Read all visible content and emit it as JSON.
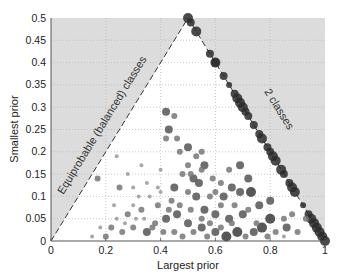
{
  "chart_data": {
    "type": "scatter",
    "title": "",
    "xlabel": "Largest prior",
    "ylabel": "Smallest prior",
    "xlim": [
      0,
      1
    ],
    "ylim": [
      0,
      0.5
    ],
    "xticks": [
      0,
      0.2,
      0.4,
      0.6,
      0.8,
      1
    ],
    "xtick_labels": [
      "0",
      "0.2",
      "0.4",
      "0.6",
      "0.8",
      "1"
    ],
    "yticks": [
      0,
      0.05,
      0.1,
      0.15,
      0.2,
      0.25,
      0.3,
      0.35,
      0.4,
      0.45,
      0.5
    ],
    "ytick_labels": [
      "0",
      "0.05",
      "0.1",
      "0.15",
      "0.2",
      "0.25",
      "0.3",
      "0.35",
      "0.4",
      "0.45",
      "0.5"
    ],
    "grid": true,
    "grid_style": "dotted",
    "legend": null,
    "annotations": [
      {
        "text": "Equiprobable (balanced) classes",
        "along": "line y = x",
        "style": "dashed"
      },
      {
        "text": "2 classes",
        "along": "line y = 1 - x",
        "style": "dashed"
      }
    ],
    "infeasible_region_shading": "light gray outside triangle (0,0)-(0.5,0.5)-(1,0)",
    "series": [
      {
        "name": "two-class datasets",
        "points": [
          [
            0.5,
            0.5,
            5
          ],
          [
            0.51,
            0.49,
            4
          ],
          [
            0.53,
            0.47,
            5
          ],
          [
            0.58,
            0.42,
            4
          ],
          [
            0.6,
            0.4,
            5
          ],
          [
            0.6,
            0.4,
            4
          ],
          [
            0.63,
            0.37,
            4
          ],
          [
            0.65,
            0.35,
            3
          ],
          [
            0.67,
            0.33,
            4
          ],
          [
            0.68,
            0.32,
            5
          ],
          [
            0.69,
            0.31,
            5
          ],
          [
            0.7,
            0.3,
            5
          ],
          [
            0.71,
            0.29,
            4
          ],
          [
            0.72,
            0.28,
            4
          ],
          [
            0.74,
            0.26,
            4
          ],
          [
            0.76,
            0.24,
            4
          ],
          [
            0.77,
            0.23,
            5
          ],
          [
            0.79,
            0.21,
            4
          ],
          [
            0.8,
            0.2,
            4
          ],
          [
            0.81,
            0.19,
            5
          ],
          [
            0.82,
            0.18,
            5
          ],
          [
            0.84,
            0.16,
            5
          ],
          [
            0.85,
            0.15,
            4
          ],
          [
            0.87,
            0.13,
            4
          ],
          [
            0.88,
            0.12,
            5
          ],
          [
            0.89,
            0.11,
            5
          ],
          [
            0.92,
            0.08,
            3
          ],
          [
            0.94,
            0.06,
            4
          ],
          [
            0.95,
            0.05,
            5
          ],
          [
            0.96,
            0.04,
            5
          ],
          [
            0.97,
            0.03,
            5
          ],
          [
            0.98,
            0.02,
            5
          ],
          [
            0.99,
            0.01,
            5
          ],
          [
            1.0,
            0.0,
            5
          ]
        ]
      },
      {
        "name": "multi-class datasets",
        "points": [
          [
            0.42,
            0.29,
            4
          ],
          [
            0.45,
            0.28,
            3
          ],
          [
            0.43,
            0.25,
            4
          ],
          [
            0.42,
            0.23,
            3
          ],
          [
            0.46,
            0.23,
            3
          ],
          [
            0.5,
            0.21,
            4
          ],
          [
            0.53,
            0.19,
            3
          ],
          [
            0.55,
            0.2,
            3
          ],
          [
            0.56,
            0.17,
            4
          ],
          [
            0.48,
            0.15,
            3
          ],
          [
            0.52,
            0.14,
            4
          ],
          [
            0.51,
            0.15,
            3
          ],
          [
            0.54,
            0.13,
            4
          ],
          [
            0.59,
            0.14,
            3
          ],
          [
            0.62,
            0.13,
            3
          ],
          [
            0.6,
            0.11,
            3
          ],
          [
            0.17,
            0.14,
            3
          ],
          [
            0.25,
            0.12,
            3
          ],
          [
            0.45,
            0.12,
            4
          ],
          [
            0.5,
            0.11,
            3
          ],
          [
            0.53,
            0.1,
            4
          ],
          [
            0.58,
            0.1,
            3
          ],
          [
            0.63,
            0.1,
            4
          ],
          [
            0.69,
            0.11,
            4
          ],
          [
            0.73,
            0.11,
            5
          ],
          [
            0.66,
            0.12,
            4
          ],
          [
            0.72,
            0.14,
            4
          ],
          [
            0.76,
            0.08,
            4
          ],
          [
            0.8,
            0.09,
            4
          ],
          [
            0.8,
            0.05,
            5
          ],
          [
            0.85,
            0.05,
            3
          ],
          [
            0.86,
            0.03,
            4
          ],
          [
            0.77,
            0.03,
            5
          ],
          [
            0.74,
            0.02,
            4
          ],
          [
            0.68,
            0.02,
            5
          ],
          [
            0.64,
            0.01,
            5
          ],
          [
            0.6,
            0.02,
            4
          ],
          [
            0.55,
            0.03,
            4
          ],
          [
            0.5,
            0.04,
            4
          ],
          [
            0.46,
            0.06,
            4
          ],
          [
            0.42,
            0.05,
            4
          ],
          [
            0.38,
            0.04,
            3
          ],
          [
            0.35,
            0.02,
            4
          ],
          [
            0.3,
            0.03,
            3
          ],
          [
            0.26,
            0.02,
            3
          ],
          [
            0.22,
            0.03,
            3
          ],
          [
            0.2,
            0.01,
            3
          ],
          [
            0.28,
            0.06,
            3
          ],
          [
            0.33,
            0.07,
            3
          ],
          [
            0.39,
            0.08,
            3
          ],
          [
            0.44,
            0.09,
            3
          ],
          [
            0.56,
            0.07,
            4
          ],
          [
            0.6,
            0.06,
            4
          ],
          [
            0.65,
            0.05,
            4
          ],
          [
            0.7,
            0.06,
            4
          ],
          [
            0.75,
            0.04,
            3
          ],
          [
            0.82,
            0.02,
            3
          ],
          [
            0.9,
            0.02,
            3
          ],
          [
            0.93,
            0.05,
            3
          ],
          [
            0.88,
            0.06,
            3
          ],
          [
            0.3,
            0.08,
            2
          ],
          [
            0.32,
            0.1,
            2
          ],
          [
            0.36,
            0.1,
            2
          ],
          [
            0.4,
            0.11,
            2
          ],
          [
            0.34,
            0.05,
            2
          ],
          [
            0.24,
            0.05,
            2
          ],
          [
            0.27,
            0.04,
            2
          ],
          [
            0.31,
            0.05,
            2
          ],
          [
            0.37,
            0.03,
            3
          ],
          [
            0.41,
            0.02,
            3
          ],
          [
            0.45,
            0.02,
            3
          ],
          [
            0.48,
            0.01,
            3
          ],
          [
            0.52,
            0.02,
            3
          ],
          [
            0.57,
            0.01,
            3
          ],
          [
            0.62,
            0.03,
            3
          ],
          [
            0.66,
            0.04,
            3
          ],
          [
            0.71,
            0.01,
            3
          ],
          [
            0.79,
            0.01,
            3
          ],
          [
            0.85,
            0.01,
            2
          ],
          [
            0.15,
            0.01,
            2
          ],
          [
            0.18,
            0.03,
            2
          ],
          [
            0.23,
            0.08,
            2
          ],
          [
            0.43,
            0.07,
            3
          ],
          [
            0.47,
            0.08,
            3
          ],
          [
            0.51,
            0.07,
            3
          ],
          [
            0.55,
            0.05,
            3
          ],
          [
            0.58,
            0.04,
            3
          ],
          [
            0.62,
            0.08,
            3
          ],
          [
            0.67,
            0.08,
            3
          ],
          [
            0.72,
            0.07,
            3
          ],
          [
            0.39,
            0.12,
            2
          ],
          [
            0.35,
            0.13,
            2
          ],
          [
            0.3,
            0.12,
            2
          ],
          [
            0.28,
            0.15,
            2
          ],
          [
            0.33,
            0.17,
            2
          ],
          [
            0.24,
            0.19,
            2
          ],
          [
            0.5,
            0.17,
            3
          ],
          [
            0.47,
            0.2,
            3
          ],
          [
            0.55,
            0.16,
            3
          ],
          [
            0.65,
            0.16,
            3
          ],
          [
            0.69,
            0.17,
            4
          ],
          [
            0.4,
            0.16,
            2
          ]
        ]
      }
    ]
  },
  "axes": {
    "xlabel": "Largest prior",
    "ylabel": "Smallest prior"
  },
  "annotations": {
    "left": "Equiprobable (balanced) classes",
    "right": "2 classes"
  }
}
